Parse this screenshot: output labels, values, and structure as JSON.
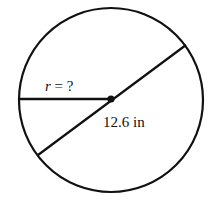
{
  "diagram": {
    "radius_label_var": "r",
    "radius_label_rest": " = ?",
    "diameter_label": "12.6 in",
    "stroke_color": "#111111",
    "background": "#ffffff"
  }
}
